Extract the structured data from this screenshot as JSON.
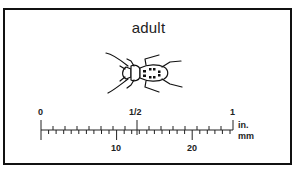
{
  "figure": {
    "title": "adult",
    "subject_icon": "beetle-icon",
    "scale": {
      "inch_labels": [
        "0",
        "1/2",
        "1"
      ],
      "mm_labels": [
        "10",
        "20"
      ],
      "unit_top": "in.",
      "unit_bottom": "mm",
      "inch_range": [
        0,
        1
      ],
      "mm_range": [
        0,
        25
      ]
    }
  }
}
